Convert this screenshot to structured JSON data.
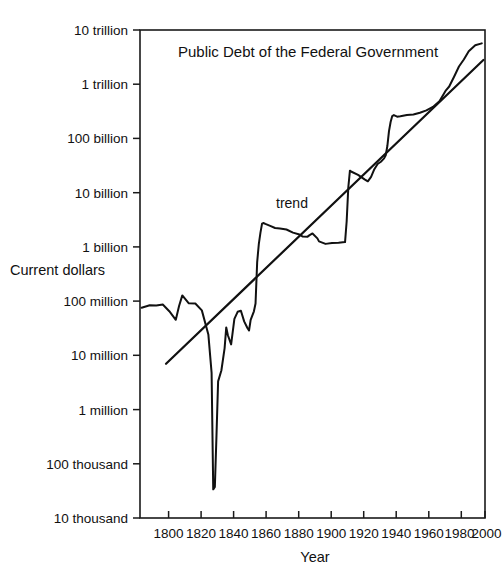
{
  "chart_data": {
    "type": "line",
    "title": "Public Debt of the Federal Government",
    "xlabel": "Year",
    "ylabel": "Current dollars",
    "yscale": "log",
    "ylim": [
      10000,
      10000000000000
    ],
    "xlim": [
      1790,
      2002
    ],
    "grid": false,
    "legend": null,
    "ytick_labels": [
      "10 thousand",
      "100 thousand",
      "1 million",
      "10 million",
      "100 million",
      "1 billion",
      "10 billion",
      "100 billion",
      "1 trillion",
      "10 trillion"
    ],
    "ytick_values": [
      10000,
      100000,
      1000000,
      10000000,
      100000000,
      1000000000,
      10000000000,
      100000000000,
      1000000000000,
      10000000000000
    ],
    "xtick_labels": [
      "1800",
      "1820",
      "1840",
      "1860",
      "1880",
      "1900",
      "1920",
      "1940",
      "1960",
      "1980",
      "2000"
    ],
    "xtick_values": [
      1800,
      1820,
      1840,
      1860,
      1880,
      1900,
      1920,
      1940,
      1960,
      1980,
      2000
    ],
    "annotations": [
      {
        "text": "trend",
        "x": 1884,
        "y": 4000000000
      }
    ],
    "series": [
      {
        "name": "Public debt",
        "style": "solid-line",
        "x": [
          1791,
          1796,
          1800,
          1804,
          1808,
          1812,
          1814,
          1816,
          1820,
          1824,
          1828,
          1832,
          1834,
          1835,
          1836,
          1837,
          1838,
          1840,
          1842,
          1843,
          1844,
          1846,
          1848,
          1850,
          1852,
          1854,
          1856,
          1857,
          1858,
          1860,
          1861,
          1862,
          1863,
          1864,
          1865,
          1866,
          1867,
          1870,
          1873,
          1876,
          1880,
          1884,
          1888,
          1890,
          1893,
          1894,
          1896,
          1899,
          1900,
          1904,
          1908,
          1912,
          1916,
          1917,
          1918,
          1919,
          1920,
          1924,
          1928,
          1930,
          1932,
          1934,
          1936,
          1938,
          1940,
          1941,
          1942,
          1943,
          1944,
          1945,
          1946,
          1948,
          1950,
          1954,
          1958,
          1962,
          1966,
          1970,
          1974,
          1978,
          1980,
          1983,
          1986,
          1989,
          1992,
          1996,
          2000
        ],
        "y": [
          75463477,
          83762172,
          82976294,
          86427121,
          65196318,
          45209738,
          81487846,
          127334934,
          91015566,
          90269778,
          67475044,
          24322235,
          4760082,
          33733,
          37513,
          336958,
          3308124,
          5250876,
          13594480,
          32742922,
          23461652,
          15925303,
          47044862,
          63452774,
          66199342,
          42242222,
          31972538,
          28701375,
          44913780,
          64842288,
          90580874,
          524177000,
          1119774000,
          1815831000,
          2677929000,
          2755764000,
          2650168000,
          2436453000,
          2234483000,
          2180395000,
          2090909000,
          1830528000,
          1692859000,
          1552141000,
          1545996000,
          1632253000,
          1769840000,
          1436701000,
          1263417000,
          1136259000,
          1177690000,
          1193839000,
          1225146000,
          2975619000,
          12455225000,
          25484506000,
          24299321000,
          21250813000,
          17604293000,
          16185310000,
          19487002000,
          27053141000,
          33778543000,
          37164740000,
          42967531000,
          48961444000,
          72422445000,
          136696090000,
          201003387000,
          258682187000,
          269422099000,
          252292247000,
          257357352000,
          271259599000,
          276343217000,
          298200822000,
          329319249000,
          380920506000,
          486247000000,
          771544000000,
          907701000000,
          1377210000000,
          2125303000000,
          2857431000000,
          4064621000000,
          5224811000000,
          5674178000000
        ]
      }
    ],
    "trend": {
      "name": "trend",
      "style": "straight-line",
      "x": [
        1806,
        2001
      ],
      "y": [
        7000000,
        2800000000000
      ],
      "description": "Straight line on the log scale indicating roughly constant exponential growth"
    }
  },
  "chart": {
    "title": "Public Debt of the Federal Government",
    "xlabel": "Year",
    "ylabel": "Current dollars",
    "trend_label": "trend"
  }
}
